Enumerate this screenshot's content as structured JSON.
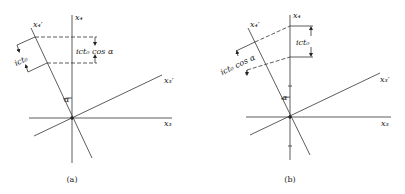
{
  "figures": [
    {
      "id": "a",
      "caption": "(a)",
      "axes": {
        "x4": "x₄",
        "x4_prime": "x₄′",
        "x3": "x₃",
        "x3_prime": "x₃′"
      },
      "angle_label": "α",
      "measure_along_x4_prime": "ict₀",
      "measure_along_x4": "ict₀ cos α"
    },
    {
      "id": "b",
      "caption": "(b)",
      "axes": {
        "x4": "x₄",
        "x4_prime": "x₄′",
        "x3": "x₃",
        "x3_prime": "x₃′"
      },
      "angle_label": "α",
      "measure_along_x4_prime": "ict₀ cos α",
      "measure_along_x4": "ict₀"
    }
  ],
  "colors": {
    "line": "#333333",
    "background": "#ffffff"
  }
}
